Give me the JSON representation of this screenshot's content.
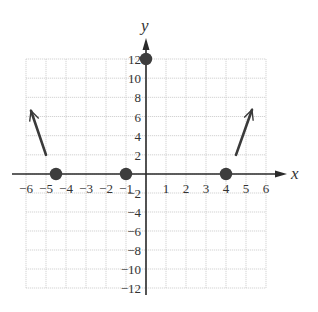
{
  "chart_data": {
    "type": "scatter",
    "title": "",
    "xlabel": "x",
    "ylabel": "y",
    "xlim": [
      -6,
      6
    ],
    "ylim": [
      -12,
      12
    ],
    "grid": true,
    "x_ticks": [
      -6,
      -5,
      -4,
      -3,
      -2,
      -1,
      1,
      2,
      3,
      4,
      5,
      6
    ],
    "y_ticks": [
      12,
      10,
      8,
      6,
      4,
      2,
      -2,
      -4,
      -6,
      -8,
      -10,
      -12
    ],
    "x_tick_labels": [
      "−6",
      "−5",
      "−4",
      "−3",
      "−2",
      "−1",
      "1",
      "2",
      "3",
      "4",
      "5",
      "6"
    ],
    "y_tick_labels": [
      "12",
      "10",
      "8",
      "6",
      "4",
      "2",
      "−2",
      "−4",
      "−6",
      "−8",
      "−10",
      "−12"
    ],
    "points": [
      {
        "x": -4.5,
        "y": 0,
        "label": "x-intercept"
      },
      {
        "x": -1,
        "y": 0,
        "label": "x-intercept"
      },
      {
        "x": 4,
        "y": 0,
        "label": "x-intercept"
      },
      {
        "x": 0,
        "y": 12,
        "label": "y-intercept"
      }
    ],
    "end_behavior_arrows": [
      {
        "from": {
          "x": -5,
          "y": 2
        },
        "to": {
          "x": -5.75,
          "y": 6.6
        },
        "direction": "up-left"
      },
      {
        "from": {
          "x": 4.5,
          "y": 2
        },
        "to": {
          "x": 5.3,
          "y": 6.7
        },
        "direction": "up-right"
      }
    ]
  },
  "colors": {
    "grid": "#c8c8c8",
    "axis": "#2a2a2a",
    "point": "#3d3d3d",
    "text": "#333333"
  }
}
